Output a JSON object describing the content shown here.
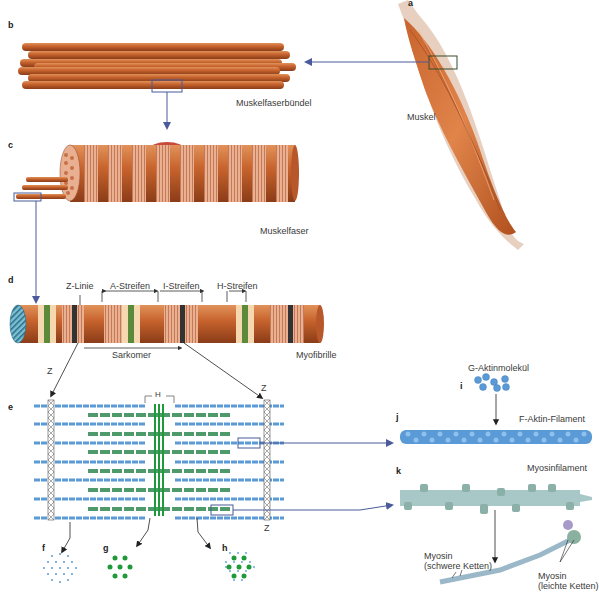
{
  "panels": {
    "a": "a",
    "b": "b",
    "c": "c",
    "d": "d",
    "e": "e",
    "f": "f",
    "g": "g",
    "h": "h",
    "i": "i",
    "j": "j",
    "k": "k"
  },
  "labels": {
    "muskel": "Muskel",
    "muskelfaserbuendel": "Muskelfaserbündel",
    "muskelfaser": "Muskelfaser",
    "myofibrille": "Myofibrille",
    "z_linie": "Z-Linie",
    "a_streifen": "A-Streifen",
    "i_streifen": "I-Streifen",
    "h_streifen": "H-Streifen",
    "sarkomer": "Sarkomer",
    "z_left": "Z",
    "z_right_top": "Z",
    "z_right_bottom": "Z",
    "h_zone": "H",
    "g_aktinmolekuel": "G-Aktinmolekül",
    "f_aktin_filament": "F-Aktin-Filament",
    "myosinfilament": "Myosinfilament",
    "myosin_schwer_line1": "Myosin",
    "myosin_schwer_line2": "(schwere Ketten)",
    "myosin_leicht_line1": "Myosin",
    "myosin_leicht_line2": "(leichte Ketten)"
  },
  "colors": {
    "muscle": "#c8642e",
    "muscle_dark": "#9a4420",
    "fiber_light": "#f0b89a",
    "actin": "#5a9ad6",
    "myosin": "#4f9a6a",
    "myosin_band": "#1f9a3a",
    "arrow": "#4a5a9a",
    "zline": "#333333"
  }
}
